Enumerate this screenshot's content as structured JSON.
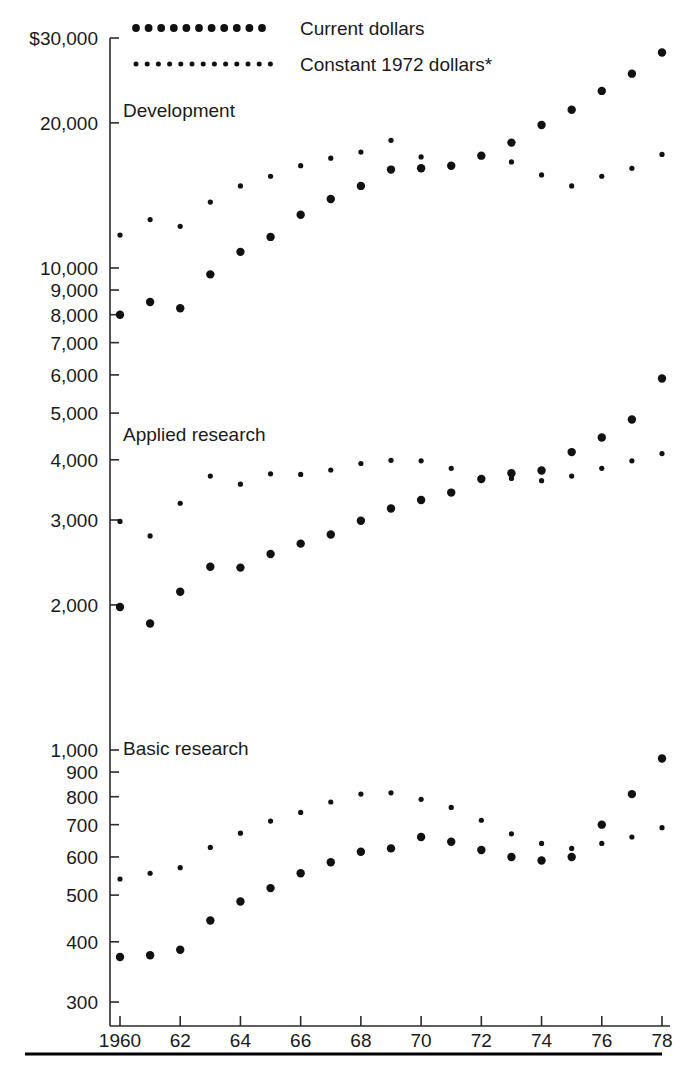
{
  "legend": {
    "position": "top-left-inside",
    "entries": [
      {
        "key": "current",
        "label": "Current dollars",
        "marker": "large-dots"
      },
      {
        "key": "constant",
        "label": "Constant 1972 dollars*",
        "marker": "small-dots"
      }
    ]
  },
  "axes": {
    "y": {
      "scale": "log",
      "label": "",
      "ticks": [
        300,
        400,
        500,
        600,
        700,
        800,
        900,
        1000,
        2000,
        3000,
        4000,
        5000,
        6000,
        7000,
        8000,
        9000,
        10000,
        20000,
        30000
      ],
      "tick_labels": [
        "300",
        "400",
        "500",
        "600",
        "700",
        "800",
        "900",
        "1,000",
        "2,000",
        "3,000",
        "4,000",
        "5,000",
        "6,000",
        "7,000",
        "8,000",
        "9,000",
        "10,000",
        "20,000",
        "$30,000"
      ],
      "range": [
        280,
        33000
      ]
    },
    "x": {
      "scale": "linear",
      "label": "",
      "ticks": [
        1960,
        1962,
        1964,
        1966,
        1968,
        1970,
        1972,
        1974,
        1976,
        1978
      ],
      "tick_labels": [
        "1960",
        "62",
        "64",
        "66",
        "68",
        "70",
        "72",
        "74",
        "76",
        "78"
      ],
      "range": [
        1960,
        1978
      ]
    },
    "grid": false
  },
  "panel_labels": [
    {
      "key": "development",
      "label": "Development"
    },
    {
      "key": "applied",
      "label": "Applied research"
    },
    {
      "key": "basic",
      "label": "Basic research"
    }
  ],
  "colors": {
    "ink": "#111111",
    "axis": "#2b2b2b",
    "background": "#ffffff"
  },
  "chart_data": {
    "type": "scatter",
    "title": "",
    "subtitle": "",
    "xlabel": "",
    "ylabel": "",
    "yscale": "log",
    "ylim": [
      280,
      33000
    ],
    "xlim": [
      1960,
      1978
    ],
    "grid": false,
    "legend_position": "top-left",
    "x": [
      1960,
      1961,
      1962,
      1963,
      1964,
      1965,
      1966,
      1967,
      1968,
      1969,
      1970,
      1971,
      1972,
      1973,
      1974,
      1975,
      1976,
      1977,
      1978
    ],
    "groups": [
      {
        "name": "Development",
        "series": [
          {
            "name": "Current dollars",
            "marker": "large-dots",
            "values": [
              8000,
              8500,
              8250,
              9700,
              10800,
              11600,
              12900,
              13900,
              14800,
              16000,
              16100,
              16300,
              17100,
              18200,
              19800,
              21300,
              23300,
              25300,
              28000
            ]
          },
          {
            "name": "Constant 1972 dollars*",
            "marker": "small-dots",
            "values": [
              11700,
              12600,
              12200,
              13700,
              14800,
              15500,
              16300,
              16900,
              17400,
              18400,
              17000,
              16300,
              17100,
              16600,
              15600,
              14800,
              15500,
              16100,
              17200
            ]
          }
        ]
      },
      {
        "name": "Applied research",
        "series": [
          {
            "name": "Current dollars",
            "marker": "large-dots",
            "values": [
              1980,
              1830,
              2130,
              2400,
              2390,
              2550,
              2680,
              2800,
              2990,
              3170,
              3300,
              3420,
              3650,
              3750,
              3800,
              4150,
              4450,
              4850,
              5900
            ]
          },
          {
            "name": "Constant 1972 dollars*",
            "marker": "small-dots",
            "values": [
              2980,
              2780,
              3250,
              3700,
              3560,
              3740,
              3730,
              3810,
              3930,
              3990,
              3980,
              3840,
              3650,
              3660,
              3620,
              3700,
              3840,
              3980,
              4120
            ]
          }
        ]
      },
      {
        "name": "Basic research",
        "series": [
          {
            "name": "Current dollars",
            "marker": "large-dots",
            "values": [
              372,
              375,
              385,
              443,
              485,
              517,
              555,
              585,
              615,
              625,
              660,
              645,
              620,
              600,
              590,
              600,
              700,
              810,
              960
            ]
          },
          {
            "name": "Constant 1972 dollars*",
            "marker": "small-dots",
            "values": [
              540,
              555,
              570,
              628,
              672,
              712,
              742,
              780,
              810,
              815,
              790,
              760,
              715,
              670,
              640,
              625,
              640,
              660,
              690
            ]
          }
        ]
      }
    ]
  }
}
